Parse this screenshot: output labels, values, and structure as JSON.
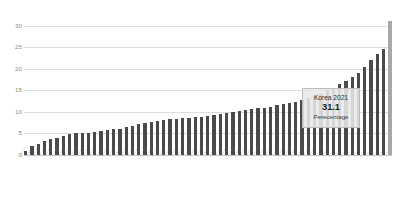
{
  "chart_data": {
    "type": "bar",
    "title": "",
    "subtitle": "",
    "xlabel": "",
    "ylabel": "",
    "ylim": [
      0,
      32
    ],
    "grid": true,
    "legend": "none",
    "yticks": [
      "0",
      "5",
      "10",
      "15",
      "20",
      "25",
      "30"
    ],
    "ytick_values": [
      0,
      5,
      10,
      15,
      20,
      25,
      30
    ],
    "highlight_index": 58,
    "highlight_color": "#a8a8a8",
    "bar_color": "#4a4a4a",
    "categories": [
      "",
      "",
      "",
      "",
      "",
      "",
      "",
      "",
      "",
      "",
      "",
      "",
      "",
      "",
      "",
      "",
      "",
      "",
      "",
      "",
      "",
      "",
      "",
      "",
      "",
      "",
      "",
      "",
      "",
      "",
      "",
      "",
      "",
      "",
      "",
      "",
      "",
      "",
      "",
      "",
      "",
      "",
      "",
      "",
      "",
      "",
      "",
      "",
      "",
      "",
      "",
      "",
      "",
      "",
      "",
      "",
      "",
      "",
      ""
    ],
    "values": [
      1.0,
      2.2,
      2.6,
      3.2,
      3.6,
      4.0,
      4.4,
      4.8,
      5.0,
      5.1,
      5.2,
      5.4,
      5.6,
      5.8,
      6.0,
      6.1,
      6.4,
      6.8,
      7.2,
      7.4,
      7.6,
      7.9,
      8.1,
      8.3,
      8.4,
      8.5,
      8.6,
      8.7,
      8.9,
      9.0,
      9.2,
      9.5,
      9.8,
      9.9,
      10.1,
      10.4,
      10.6,
      10.8,
      11.0,
      11.2,
      11.5,
      11.8,
      12.0,
      12.4,
      12.8,
      13.2,
      13.6,
      14.2,
      15.0,
      15.6,
      16.4,
      17.2,
      18.0,
      19.0,
      20.4,
      22.0,
      23.4,
      24.6,
      31.1
    ]
  },
  "callout": {
    "title": "Korea 2021",
    "value": "31.1",
    "unit": "Perecentage"
  }
}
